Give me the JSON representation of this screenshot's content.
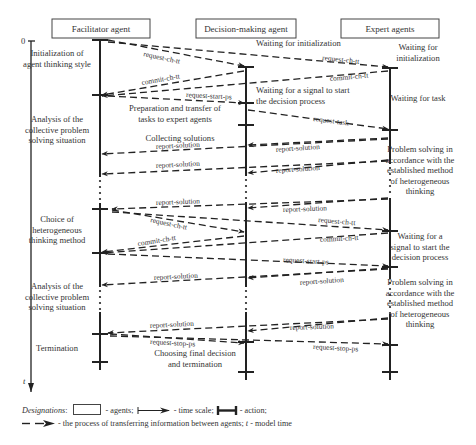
{
  "agents": [
    {
      "label": "Facilitator agent",
      "x": 100,
      "box": [
        52,
        19,
        98,
        19
      ]
    },
    {
      "label": "Decision-making agent",
      "x": 246,
      "box": [
        196,
        19,
        100,
        19
      ]
    },
    {
      "label": "Expert agents",
      "x": 390,
      "box": [
        341,
        19,
        98,
        19
      ]
    }
  ],
  "time_axis": {
    "origin_label": "0",
    "axis_label": "t",
    "x": 31,
    "y_start": 41,
    "y_end": 392
  },
  "facilitator_states": [
    {
      "lines": [
        "Initialization of",
        "agent thinking style"
      ],
      "x": 57,
      "y": 56
    },
    {
      "lines": [
        "Analysis of the",
        "collective problem",
        "solving situation"
      ],
      "x": 57,
      "y": 122
    },
    {
      "lines": [
        "Choice of",
        "heterogeneous",
        "thinking method"
      ],
      "x": 57,
      "y": 222
    },
    {
      "lines": [
        "Analysis of the",
        "collective problem",
        "solving situation"
      ],
      "x": 57,
      "y": 289
    },
    {
      "lines": [
        "Termination"
      ],
      "x": 57,
      "y": 351
    }
  ],
  "decision_states": [
    {
      "lines": [
        "Waiting for initialization"
      ],
      "x": 256,
      "y": 46,
      "anchor": "start"
    },
    {
      "lines": [
        "Waiting for a signal to start",
        "the decision process"
      ],
      "x": 256,
      "y": 93,
      "anchor": "start"
    },
    {
      "lines": [
        "Preparation and transfer of",
        "tasks to expert agents"
      ],
      "x": 175,
      "y": 111,
      "anchor": "middle"
    },
    {
      "lines": [
        "Collecting solutions"
      ],
      "x": 180,
      "y": 141,
      "anchor": "middle"
    },
    {
      "lines": [
        "Choosing final decision",
        "and termination"
      ],
      "x": 195,
      "y": 356,
      "anchor": "middle"
    }
  ],
  "expert_states": [
    {
      "lines": [
        "Waiting for",
        "initialization"
      ],
      "x": 418,
      "y": 50
    },
    {
      "lines": [
        "Waiting for task"
      ],
      "x": 418,
      "y": 101
    },
    {
      "lines": [
        "Problem solving in",
        "accordance with the",
        "established method",
        "of heterogeneous",
        "thinking"
      ],
      "x": 420,
      "y": 152
    },
    {
      "lines": [
        "Waiting for a",
        "signal to start the",
        "decision process"
      ],
      "x": 420,
      "y": 239
    },
    {
      "lines": [
        "Problem solving in",
        "accordance with the",
        "established method",
        "of heterogeneous",
        "thinking"
      ],
      "x": 420,
      "y": 285
    }
  ],
  "messages": [
    {
      "label": "request-ch-tt",
      "x1": 108,
      "y1": 40,
      "x2": 244,
      "y2": 66,
      "lx": 143,
      "ly": 56,
      "rot": 12
    },
    {
      "label": "request-ch-tt",
      "x1": 108,
      "y1": 42,
      "x2": 388,
      "y2": 67,
      "lx": 322,
      "ly": 60,
      "rot": 6
    },
    {
      "label": "commit-ch-tt",
      "x1": 244,
      "y1": 71,
      "x2": 102,
      "y2": 95,
      "lx": 142,
      "ly": 85,
      "rot": -10
    },
    {
      "label": "commit-ch-tt",
      "x1": 388,
      "y1": 71,
      "x2": 102,
      "y2": 96,
      "lx": 330,
      "ly": 81,
      "rot": -5
    },
    {
      "label": "request-start-ps",
      "x1": 108,
      "y1": 96,
      "x2": 244,
      "y2": 103,
      "lx": 186,
      "ly": 97,
      "rot": 3
    },
    {
      "label": "request-task",
      "x1": 248,
      "y1": 110,
      "x2": 388,
      "y2": 129,
      "lx": 313,
      "ly": 121,
      "rot": 7
    },
    {
      "label": "report-solution",
      "x1": 388,
      "y1": 138,
      "x2": 248,
      "y2": 145,
      "lx": 276,
      "ly": 152,
      "rot": -4
    },
    {
      "label": "report-solution",
      "x1": 388,
      "y1": 139,
      "x2": 102,
      "y2": 154,
      "lx": 156,
      "ly": 149,
      "rot": -3
    },
    {
      "label": "report-solution",
      "x1": 388,
      "y1": 160,
      "x2": 248,
      "y2": 173,
      "lx": 276,
      "ly": 173,
      "rot": -4
    },
    {
      "label": "report-solution",
      "x1": 388,
      "y1": 161,
      "x2": 102,
      "y2": 174,
      "lx": 156,
      "ly": 168,
      "rot": -3
    },
    {
      "label": "report-solution",
      "x1": 388,
      "y1": 198,
      "x2": 248,
      "y2": 208,
      "lx": 283,
      "ly": 212,
      "rot": -2
    },
    {
      "label": "report-solution",
      "x1": 388,
      "y1": 199,
      "x2": 112,
      "y2": 209,
      "lx": 156,
      "ly": 205,
      "rot": -2
    },
    {
      "label": "request-ch-tt",
      "x1": 112,
      "y1": 210,
      "x2": 244,
      "y2": 232,
      "lx": 150,
      "ly": 222,
      "rot": 12
    },
    {
      "label": "request-ch-tt",
      "x1": 112,
      "y1": 212,
      "x2": 388,
      "y2": 230,
      "lx": 318,
      "ly": 222,
      "rot": 5
    },
    {
      "label": "commit-ch-tt",
      "x1": 244,
      "y1": 236,
      "x2": 102,
      "y2": 252,
      "lx": 138,
      "ly": 246,
      "rot": -9
    },
    {
      "label": "commit-ch-tt",
      "x1": 388,
      "y1": 233,
      "x2": 102,
      "y2": 253,
      "lx": 320,
      "ly": 242,
      "rot": -3
    },
    {
      "label": "request-start-ps",
      "x1": 108,
      "y1": 254,
      "x2": 388,
      "y2": 266,
      "lx": 283,
      "ly": 262,
      "rot": 3
    },
    {
      "label": "report-solution",
      "x1": 388,
      "y1": 268,
      "x2": 248,
      "y2": 278,
      "lx": 300,
      "ly": 285,
      "rot": -4
    },
    {
      "label": "report-solution",
      "x1": 388,
      "y1": 269,
      "x2": 102,
      "y2": 285,
      "lx": 154,
      "ly": 280,
      "rot": -3
    },
    {
      "label": "report-solution",
      "x1": 388,
      "y1": 318,
      "x2": 248,
      "y2": 331,
      "lx": 290,
      "ly": 330,
      "rot": -2
    },
    {
      "label": "report-solution",
      "x1": 388,
      "y1": 319,
      "x2": 108,
      "y2": 333,
      "lx": 150,
      "ly": 328,
      "rot": -3
    },
    {
      "label": "request-stop-ps",
      "x1": 110,
      "y1": 334,
      "x2": 244,
      "y2": 343,
      "lx": 150,
      "ly": 344,
      "rot": 3
    },
    {
      "label": "request-stop-ps",
      "x1": 110,
      "y1": 336,
      "x2": 388,
      "y2": 344,
      "lx": 313,
      "ly": 349,
      "rot": 3
    }
  ],
  "action_ticks": {
    "facilitator": [
      40,
      95,
      209,
      253,
      334,
      362
    ],
    "decision": [
      67,
      103,
      125,
      342,
      372
    ],
    "expert": [
      68,
      130,
      231,
      267,
      345,
      372
    ]
  },
  "dotted_gaps": {
    "facilitator": [
      [
        177,
        203
      ],
      [
        287,
        312
      ]
    ],
    "decision": [
      [
        176,
        202
      ],
      [
        287,
        312
      ]
    ],
    "expert": [
      [
        164,
        198
      ],
      [
        279,
        314
      ]
    ]
  },
  "legend": {
    "designations": "Designations",
    "agents": "- agents;",
    "time_scale": "- time scale;",
    "action": "- action;",
    "transfer": "- the process of transferring information between agents;",
    "model_time_var": "t",
    "model_time": "- model time"
  },
  "colors": {
    "ink": "#222222",
    "text": "#333333",
    "background": "#ffffff"
  }
}
